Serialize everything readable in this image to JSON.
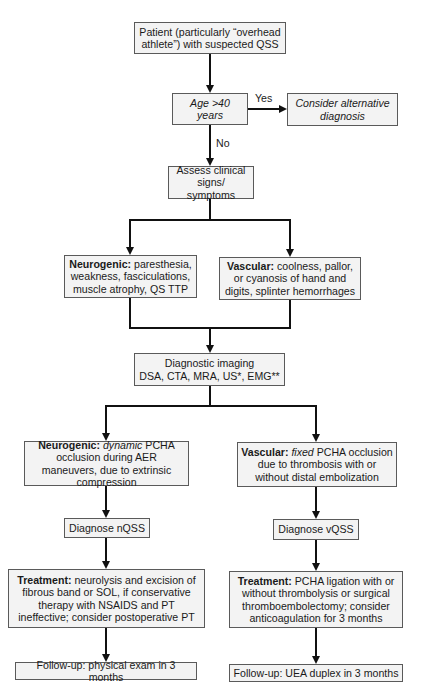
{
  "nodes": {
    "patient": {
      "text": "Patient (particularly “overhead athlete”) with suspected QSS"
    },
    "age": {
      "text": "Age >40 years"
    },
    "alternative": {
      "text": "Consider alternative diagnosis"
    },
    "assess": {
      "text": "Assess clinical signs/ symptoms"
    },
    "neuro_signs": {
      "label": "Neurogenic:",
      "text": " paresthesia, weakness, fasciculations, muscle atrophy, QS TTP"
    },
    "vasc_signs": {
      "label": "Vascular:",
      "text": " coolness, pallor, or cyanosis of hand and digits, splinter hemorrhages"
    },
    "imaging": {
      "line1": "Diagnostic imaging",
      "line2": "DSA, CTA, MRA, US*, EMG**"
    },
    "neuro_mech": {
      "label": "Neurogenic:",
      "emph": " dynamic",
      "text": " PCHA occlusion during AER maneuvers, due to extrinsic compression"
    },
    "vasc_mech": {
      "label": "Vascular:",
      "emph": " fixed",
      "text": " PCHA occlusion due to thrombosis with or without distal embolization"
    },
    "diag_n": {
      "text": "Diagnose nQSS"
    },
    "diag_v": {
      "text": "Diagnose vQSS"
    },
    "treat_n": {
      "label": "Treatment:",
      "text": " neurolysis and excision of fibrous band or SOL, if conservative therapy with NSAIDS and PT ineffective; consider postoperative PT"
    },
    "treat_v": {
      "label": "Treatment:",
      "text": " PCHA ligation with or without thrombolysis or surgical thromboembolectomy; consider anticoagulation for 3 months"
    },
    "follow_n": {
      "text": "Follow-up: physical exam in 3 months"
    },
    "follow_v": {
      "text": "Follow-up: UEA duplex in 3 months"
    }
  },
  "edge_labels": {
    "yes": "Yes",
    "no": "No"
  },
  "colors": {
    "line": "#111111",
    "box_border": "#5a5a5a",
    "box_fill": "#f3f3f3"
  }
}
